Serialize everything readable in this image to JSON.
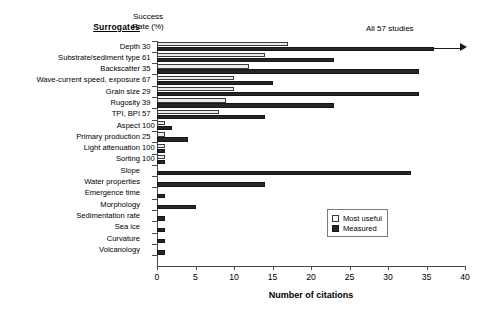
{
  "header": {
    "surrogates_title": "Surrogates",
    "success_rate_line1": "Success",
    "success_rate_line2": "Rate (%)"
  },
  "annotation": {
    "text": "All 57 studies"
  },
  "legend": {
    "position": "inside-right",
    "items": [
      {
        "label": "Most useful",
        "color": "#f4f4f4"
      },
      {
        "label": "Measured",
        "color": "#262626"
      }
    ]
  },
  "chart_data": {
    "type": "bar",
    "orientation": "horizontal",
    "title": "",
    "xlabel": "Number of citations",
    "ylabel": "Surrogates",
    "xlim": [
      0,
      40
    ],
    "xticks": [
      0,
      5,
      10,
      15,
      20,
      25,
      30,
      35,
      40
    ],
    "grid": false,
    "categories": [
      "Depth",
      "Substrate/sediment type",
      "Backscatter",
      "Wave-current speed, exposure",
      "Grain size",
      "Rugosity",
      "TPI, BPI",
      "Aspect",
      "Primary production",
      "Light attenuation",
      "Sorting",
      "Slope",
      "Water properties",
      "Emergence time",
      "Morphology",
      "Sedimentation rate",
      "Sea ice",
      "Curvature",
      "Volcanology"
    ],
    "success_rate_percent": [
      "30",
      "61",
      "35",
      "67",
      "29",
      "39",
      "57",
      "100",
      "25",
      "100",
      "100",
      "",
      "",
      "",
      "",
      "",
      "",
      "",
      ""
    ],
    "series": [
      {
        "name": "Most useful",
        "color": "#f4f4f4",
        "values": [
          17,
          14,
          12,
          10,
          10,
          9,
          8,
          1,
          1,
          1,
          1,
          0,
          0,
          0,
          0,
          0,
          0,
          0,
          0
        ]
      },
      {
        "name": "Measured",
        "color": "#262626",
        "values": [
          36,
          23,
          34,
          15,
          34,
          23,
          14,
          2,
          4,
          1,
          1,
          33,
          14,
          1,
          5,
          1,
          1,
          1,
          1
        ]
      }
    ]
  }
}
